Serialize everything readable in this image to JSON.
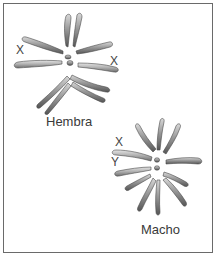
{
  "figure": {
    "female": {
      "label": "Hembra",
      "sex_chromosome_labels": [
        "X",
        "X"
      ]
    },
    "male": {
      "label": "Macho",
      "sex_chromosome_labels": [
        "X",
        "Y"
      ]
    }
  },
  "colors": {
    "chromosome_dark": "#5a5a5a",
    "chromosome_mid": "#8c8c8c",
    "chromosome_light": "#d6d6d6",
    "border": "#6a6a6a",
    "text": "#3a3a3a"
  }
}
